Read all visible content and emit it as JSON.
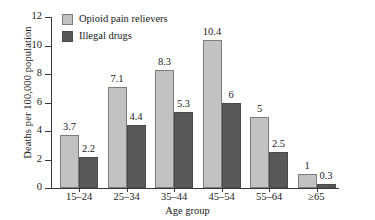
{
  "chart_data": {
    "type": "bar",
    "title": "",
    "xlabel": "Age group",
    "ylabel": "Deaths per 100,000 population",
    "categories": [
      "15–24",
      "25–34",
      "35–44",
      "45–54",
      "55–64",
      "≥65"
    ],
    "series": [
      {
        "name": "Opioid pain relievers",
        "color": "#c2c2c2",
        "values": [
          3.7,
          7.1,
          8.3,
          10.4,
          5,
          1
        ],
        "labels": [
          "3.7",
          "7.1",
          "8.3",
          "10.4",
          "5",
          "1"
        ]
      },
      {
        "name": "Illegal drugs",
        "color": "#595959",
        "values": [
          2.2,
          4.4,
          5.3,
          6,
          2.5,
          0.3
        ],
        "labels": [
          "2.2",
          "4.4",
          "5.3",
          "6",
          "2.5",
          "0.3"
        ]
      }
    ],
    "ylim": [
      0,
      12
    ],
    "yticks": [
      0,
      2,
      4,
      6,
      8,
      10,
      12
    ],
    "ytick_labels": [
      "0",
      "2",
      "4",
      "6",
      "8",
      "10",
      "12"
    ],
    "grid": false,
    "legend_position": "top-left"
  }
}
